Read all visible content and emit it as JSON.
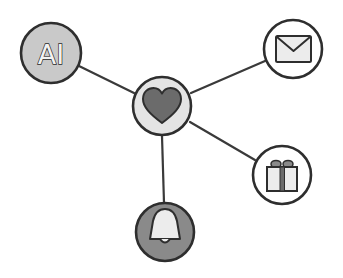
{
  "diagram": {
    "type": "hub-and-spoke network",
    "style": "hand-drawn, grayscale",
    "colors": {
      "background": "#ffffff",
      "outline": "#2e2e2e",
      "edge": "#3a3a3a",
      "light_fill": "#e4e4e4",
      "mid_fill": "#c9c9c9",
      "dark_fill": "#8a8a8a",
      "heart_fill": "#6b6b6b",
      "icon_light": "#ececec"
    },
    "hub": {
      "id": "heart",
      "icon": "heart-icon",
      "label": "",
      "x": 162,
      "y": 106,
      "r": 29
    },
    "nodes": [
      {
        "id": "ai",
        "icon": "ai-text-icon",
        "label": "AI",
        "x": 51,
        "y": 53,
        "r": 30
      },
      {
        "id": "mail",
        "icon": "envelope-icon",
        "label": "",
        "x": 293,
        "y": 49,
        "r": 29
      },
      {
        "id": "gift",
        "icon": "gift-icon",
        "label": "",
        "x": 282,
        "y": 175,
        "r": 29
      },
      {
        "id": "bell",
        "icon": "bell-icon",
        "label": "",
        "x": 165,
        "y": 232,
        "r": 29
      }
    ],
    "edges": [
      {
        "from": "heart",
        "to": "ai"
      },
      {
        "from": "heart",
        "to": "mail"
      },
      {
        "from": "heart",
        "to": "gift"
      },
      {
        "from": "heart",
        "to": "bell"
      }
    ]
  }
}
